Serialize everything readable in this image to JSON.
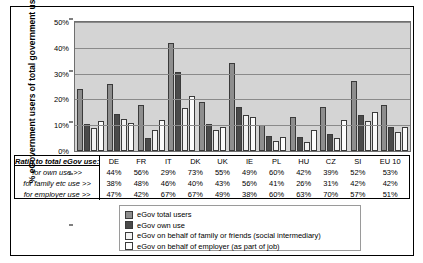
{
  "chart_data": {
    "type": "bar",
    "title": "",
    "xlabel": "",
    "ylabel": "% eGovernment users of total government users",
    "ylim": [
      0,
      50
    ],
    "ytick_labels": [
      "0%",
      "10%",
      "20%",
      "30%",
      "40%",
      "50%"
    ],
    "grid": true,
    "legend_position": "bottom",
    "categories": [
      "DE",
      "FR",
      "IT",
      "DK",
      "UK",
      "IE",
      "PL",
      "HU",
      "CZ",
      "SI",
      "EU 10"
    ],
    "series": [
      {
        "name": "eGov total users",
        "values": [
          24,
          26,
          18,
          42,
          19,
          34,
          10,
          13,
          17,
          27,
          18
        ]
      },
      {
        "name": "eGov own use",
        "values": [
          10.5,
          14.5,
          5,
          30.5,
          10.5,
          17,
          6,
          5.5,
          6.5,
          14,
          9.5
        ]
      },
      {
        "name": "eGov on behalf of family or friends (social intermediary)",
        "values": [
          9,
          12.5,
          8,
          16.5,
          8,
          14,
          4,
          3.5,
          5,
          11.5,
          7.5
        ]
      },
      {
        "name": "eGov on behalf of employer (as part of job)",
        "values": [
          11.5,
          11,
          12,
          21.5,
          9.5,
          13,
          5.5,
          8,
          12,
          15,
          9.5
        ]
      }
    ]
  },
  "table": {
    "header_label": "Ratio to total eGov use:",
    "columns": [
      "DE",
      "FR",
      "IT",
      "DK",
      "UK",
      "IE",
      "PL",
      "HU",
      "CZ",
      "SI",
      "EU 10"
    ],
    "rows": [
      {
        "label": "for own use >>",
        "values": [
          "44%",
          "56%",
          "29%",
          "73%",
          "55%",
          "49%",
          "60%",
          "42%",
          "39%",
          "52%",
          "53%"
        ]
      },
      {
        "label": "for family etc use >>",
        "values": [
          "38%",
          "48%",
          "46%",
          "40%",
          "43%",
          "56%",
          "41%",
          "26%",
          "31%",
          "42%",
          "42%"
        ]
      },
      {
        "label": "for employer use >>",
        "values": [
          "47%",
          "42%",
          "67%",
          "67%",
          "49%",
          "38%",
          "60%",
          "63%",
          "70%",
          "57%",
          "51%"
        ]
      }
    ]
  },
  "legend": {
    "items": [
      {
        "label": "eGov total users",
        "color": "#8e8e8e"
      },
      {
        "label": "eGov own use",
        "color": "#4a4a4a"
      },
      {
        "label": "eGov on behalf of family or friends (social intermediary)",
        "color": "#f2f2f2"
      },
      {
        "label": "eGov on behalf of employer (as part of job)",
        "color": "#fbfbfb"
      }
    ]
  }
}
